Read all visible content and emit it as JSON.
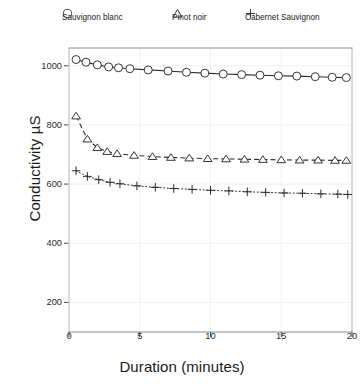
{
  "chart_data": {
    "type": "line",
    "title": "",
    "xlabel": "Duration (minutes)",
    "ylabel": "Conductivity µS",
    "xlim": [
      0,
      20
    ],
    "ylim": [
      100,
      1060
    ],
    "xticks": [
      0,
      5,
      10,
      15,
      20
    ],
    "yticks": [
      200,
      400,
      600,
      800,
      1000
    ],
    "grid": false,
    "legend_position": "top",
    "series": [
      {
        "name": "Sauvignon blanc",
        "marker": "circle",
        "linestyle": "solid",
        "color": "#2b2b2b",
        "x": [
          0.5,
          1.2,
          2.0,
          2.8,
          3.5,
          4.3,
          5.6,
          7.0,
          8.3,
          9.6,
          10.9,
          12.2,
          13.5,
          14.8,
          16.1,
          17.4,
          18.6,
          19.6
        ],
        "y": [
          1021,
          1012,
          1003,
          996,
          993,
          990,
          986,
          982,
          978,
          975,
          972,
          970,
          968,
          966,
          965,
          963,
          961,
          960
        ]
      },
      {
        "name": "Pinot noir",
        "marker": "triangle",
        "linestyle": "dashed",
        "color": "#2b2b2b",
        "x": [
          0.5,
          1.3,
          2.0,
          2.7,
          3.4,
          4.6,
          5.9,
          7.2,
          8.5,
          9.8,
          11.1,
          12.4,
          13.7,
          15.0,
          16.3,
          17.6,
          18.8,
          19.6
        ],
        "y": [
          830,
          752,
          723,
          710,
          703,
          697,
          693,
          690,
          688,
          686,
          685,
          684,
          683,
          682,
          681,
          681,
          680,
          680
        ]
      },
      {
        "name": "Cabernet Sauvignon",
        "marker": "plus",
        "linestyle": "dotted",
        "color": "#2b2b2b",
        "x": [
          0.5,
          1.3,
          2.1,
          2.9,
          3.6,
          4.8,
          6.1,
          7.4,
          8.7,
          10.0,
          11.3,
          12.6,
          13.9,
          15.2,
          16.5,
          17.8,
          19.0,
          19.7
        ],
        "y": [
          645,
          626,
          615,
          606,
          601,
          594,
          589,
          585,
          582,
          579,
          577,
          574,
          572,
          570,
          569,
          567,
          566,
          565
        ]
      }
    ]
  },
  "legend": {
    "items": [
      {
        "label": "Sauvignon blanc",
        "symbol": "circle"
      },
      {
        "label": "Pinot noir",
        "symbol": "triangle"
      },
      {
        "label": "Cabernet Sauvignon",
        "symbol": "plus"
      }
    ]
  },
  "axes": {
    "x_title": "Duration (minutes)",
    "y_title": "Conductivity µS",
    "x_tick_labels": [
      "0",
      "5",
      "10",
      "15",
      "20"
    ],
    "y_tick_labels": [
      "200",
      "400",
      "600",
      "800",
      "1000"
    ]
  }
}
